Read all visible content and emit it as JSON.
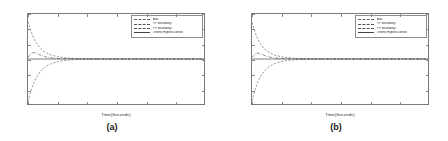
{
  "figure": {
    "background": "#ffffff",
    "panel_count": 2
  },
  "panels": [
    {
      "caption": "(a)",
      "chart_ref": 0
    },
    {
      "caption": "(b)",
      "chart_ref": 1
    }
  ],
  "chart_data": [
    {
      "type": "line",
      "title": "",
      "subtitle": "",
      "caption": "(a)",
      "xlabel": "Time(Seconds)",
      "ylabel": "",
      "xlim": [
        0,
        30
      ],
      "ylim": [
        -1.5,
        1.5
      ],
      "xticks": [
        0,
        5,
        10,
        15,
        20,
        25,
        30
      ],
      "xticklabels": [
        "0",
        "5",
        "10",
        "15",
        "20",
        "25",
        "30"
      ],
      "yticks": [
        -1.5,
        -1,
        -0.5,
        0,
        0.5,
        1,
        1.5
      ],
      "yticklabels": [
        "-1.5",
        "-1",
        "-0.5",
        "0",
        "0.5",
        "1",
        "1.5"
      ],
      "grid": false,
      "legend_position": "upper right",
      "legend": [
        {
          "label": "ANC",
          "style": "dashdot",
          "color": "#555555"
        },
        {
          "label": "PP boundary",
          "style": "dashed",
          "color": "#6a6a6a"
        },
        {
          "label": "PP boundary",
          "style": "dashed",
          "color": "#6a6a6a"
        },
        {
          "label": "Offline-Hybrid control",
          "style": "solid",
          "color": "#444444"
        }
      ],
      "series": [
        {
          "name": "ANC",
          "style": "dashdot",
          "color": "#555555",
          "x": [
            0,
            0.5,
            1,
            1.5,
            2,
            2.5,
            3,
            3.5,
            4,
            5,
            6,
            8,
            10,
            15,
            20,
            25,
            30
          ],
          "values": [
            0.05,
            0.18,
            0.22,
            0.19,
            0.14,
            0.1,
            0.07,
            0.05,
            0.035,
            0.02,
            0.012,
            0.005,
            0.002,
            0.0,
            0.0,
            0.0,
            0.0
          ]
        },
        {
          "name": "PP boundary upper",
          "style": "dashed",
          "color": "#6a6a6a",
          "x": [
            0,
            0.3,
            0.6,
            1,
            1.4,
            2,
            2.6,
            3.2,
            4,
            5,
            6,
            7,
            8,
            10,
            12,
            15,
            20,
            25,
            30
          ],
          "values": [
            1.25,
            1.05,
            0.88,
            0.68,
            0.54,
            0.38,
            0.27,
            0.2,
            0.13,
            0.08,
            0.05,
            0.03,
            0.02,
            0.01,
            0.005,
            0.0,
            0.0,
            0.0,
            0.0
          ]
        },
        {
          "name": "PP boundary lower",
          "style": "dashed",
          "color": "#6a6a6a",
          "x": [
            0,
            0.3,
            0.6,
            1,
            1.4,
            2,
            2.6,
            3.2,
            4,
            5,
            6,
            7,
            8,
            10,
            12,
            15,
            20,
            25,
            30
          ],
          "values": [
            -1.42,
            -1.2,
            -1.0,
            -0.78,
            -0.62,
            -0.44,
            -0.31,
            -0.23,
            -0.15,
            -0.09,
            -0.055,
            -0.035,
            -0.02,
            -0.01,
            -0.005,
            0.0,
            0.0,
            0.0,
            0.0
          ]
        },
        {
          "name": "Offline-Hybrid control",
          "style": "solid",
          "color": "#444444",
          "x": [
            0,
            5,
            10,
            15,
            20,
            25,
            30
          ],
          "values": [
            0.0,
            0.0,
            0.0,
            0.0,
            0.0,
            0.0,
            0.0
          ]
        }
      ]
    },
    {
      "type": "line",
      "title": "",
      "subtitle": "",
      "caption": "(b)",
      "xlabel": "Time(Seconds)",
      "ylabel": "",
      "xlim": [
        0,
        30
      ],
      "ylim": [
        -1.5,
        1.5
      ],
      "xticks": [
        0,
        5,
        10,
        15,
        20,
        25,
        30
      ],
      "xticklabels": [
        "0",
        "5",
        "10",
        "15",
        "20",
        "25",
        "30"
      ],
      "yticks": [
        -1.5,
        -1,
        -0.5,
        0,
        0.5,
        1,
        1.5
      ],
      "yticklabels": [
        "-1.5",
        "-1",
        "-0.5",
        "0",
        "0.5",
        "1",
        "1.5"
      ],
      "grid": false,
      "legend_position": "upper right",
      "legend": [
        {
          "label": "ANC",
          "style": "dashdot",
          "color": "#555555"
        },
        {
          "label": "PP boundary",
          "style": "dashed",
          "color": "#6a6a6a"
        },
        {
          "label": "PP boundary",
          "style": "dashed",
          "color": "#6a6a6a"
        },
        {
          "label": "Offline-Hybrid control",
          "style": "solid",
          "color": "#444444"
        }
      ],
      "series": [
        {
          "name": "ANC",
          "style": "dashdot",
          "color": "#555555",
          "x": [
            0,
            0.5,
            1,
            1.5,
            2,
            2.5,
            3,
            3.5,
            4,
            5,
            6,
            8,
            10,
            15,
            20,
            25,
            30
          ],
          "values": [
            0.05,
            0.16,
            0.2,
            0.17,
            0.13,
            0.09,
            0.065,
            0.045,
            0.03,
            0.018,
            0.01,
            0.004,
            0.002,
            0.0,
            0.0,
            0.0,
            0.0
          ]
        },
        {
          "name": "PP boundary upper",
          "style": "dashed",
          "color": "#6a6a6a",
          "x": [
            0,
            0.3,
            0.6,
            1,
            1.4,
            2,
            2.6,
            3.2,
            4,
            5,
            6,
            7,
            8,
            10,
            12,
            15,
            20,
            25,
            30
          ],
          "values": [
            1.22,
            1.02,
            0.85,
            0.66,
            0.52,
            0.36,
            0.26,
            0.19,
            0.12,
            0.075,
            0.045,
            0.028,
            0.018,
            0.009,
            0.004,
            0.0,
            0.0,
            0.0,
            0.0
          ]
        },
        {
          "name": "PP boundary lower",
          "style": "dashed",
          "color": "#6a6a6a",
          "x": [
            0,
            0.3,
            0.6,
            1,
            1.4,
            2,
            2.6,
            3.2,
            4,
            5,
            6,
            7,
            8,
            10,
            12,
            15,
            20,
            25,
            30
          ],
          "values": [
            -1.4,
            -1.18,
            -0.98,
            -0.76,
            -0.6,
            -0.43,
            -0.3,
            -0.22,
            -0.14,
            -0.085,
            -0.05,
            -0.032,
            -0.019,
            -0.009,
            -0.004,
            0.0,
            0.0,
            0.0,
            0.0
          ]
        },
        {
          "name": "Offline-Hybrid control",
          "style": "solid",
          "color": "#444444",
          "x": [
            0,
            5,
            10,
            15,
            20,
            25,
            30
          ],
          "values": [
            0.0,
            0.0,
            0.0,
            0.0,
            0.0,
            0.0,
            0.0
          ]
        }
      ]
    }
  ]
}
